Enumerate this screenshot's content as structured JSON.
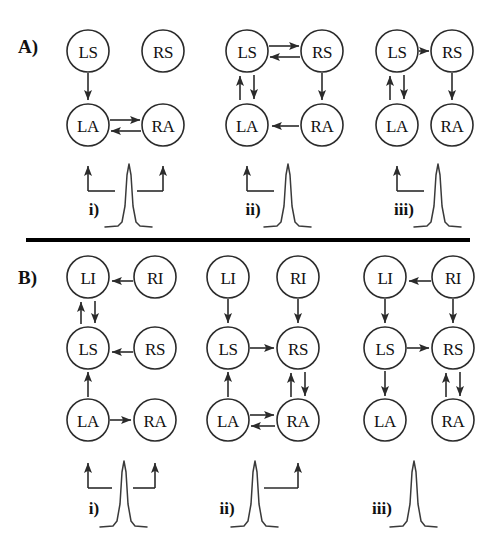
{
  "figure": {
    "width": 491,
    "height": 546,
    "background_color": "#ffffff",
    "line_color": "#2b2b2b",
    "divider_color": "#000000"
  },
  "panels": [
    {
      "id": "A",
      "label": "A)",
      "nodes_legend": [
        "LS",
        "RS",
        "LA",
        "RA"
      ],
      "columns": [
        {
          "id": "A-i",
          "sub_label": "i)",
          "nodes": [
            {
              "name": "LS",
              "row": "top",
              "side": "left"
            },
            {
              "name": "RS",
              "row": "top",
              "side": "right"
            },
            {
              "name": "LA",
              "row": "bottom",
              "side": "left"
            },
            {
              "name": "RA",
              "row": "bottom",
              "side": "right"
            }
          ],
          "edges": [
            {
              "from": "LS",
              "to": "LA",
              "kind": "vertical-down"
            },
            {
              "from": "LA",
              "to": "RA",
              "kind": "horizontal-bidirectional"
            }
          ],
          "stimulus": {
            "targets": [
              "LA",
              "RA"
            ],
            "bracket": "both"
          }
        },
        {
          "id": "A-ii",
          "sub_label": "ii)",
          "nodes": [
            {
              "name": "LS",
              "row": "top",
              "side": "left"
            },
            {
              "name": "RS",
              "row": "top",
              "side": "right"
            },
            {
              "name": "LA",
              "row": "bottom",
              "side": "left"
            },
            {
              "name": "RA",
              "row": "bottom",
              "side": "right"
            }
          ],
          "edges": [
            {
              "from": "LS",
              "to": "RS",
              "kind": "horizontal-bidirectional"
            },
            {
              "from": "LS",
              "to": "LA",
              "kind": "vertical-bidirectional"
            },
            {
              "from": "RS",
              "to": "RA",
              "kind": "vertical-down"
            },
            {
              "from": "RA",
              "to": "LA",
              "kind": "horizontal-left"
            }
          ],
          "stimulus": {
            "targets": [
              "LA"
            ],
            "bracket": "left"
          }
        },
        {
          "id": "A-iii",
          "sub_label": "iii)",
          "nodes": [
            {
              "name": "LS",
              "row": "top",
              "side": "left"
            },
            {
              "name": "RS",
              "row": "top",
              "side": "right"
            },
            {
              "name": "LA",
              "row": "bottom",
              "side": "left"
            },
            {
              "name": "RA",
              "row": "bottom",
              "side": "right"
            }
          ],
          "edges": [
            {
              "from": "LS",
              "to": "RS",
              "kind": "horizontal-right"
            },
            {
              "from": "LS",
              "to": "LA",
              "kind": "vertical-bidirectional"
            },
            {
              "from": "RS",
              "to": "RA",
              "kind": "vertical-down"
            }
          ],
          "stimulus": {
            "targets": [
              "LA"
            ],
            "bracket": "left"
          }
        }
      ]
    },
    {
      "id": "B",
      "label": "B)",
      "nodes_legend": [
        "LI",
        "RI",
        "LS",
        "RS",
        "LA",
        "RA"
      ],
      "columns": [
        {
          "id": "B-i",
          "sub_label": "i)",
          "nodes": [
            {
              "name": "LI",
              "row": "top",
              "side": "left"
            },
            {
              "name": "RI",
              "row": "top",
              "side": "right"
            },
            {
              "name": "LS",
              "row": "middle",
              "side": "left"
            },
            {
              "name": "RS",
              "row": "middle",
              "side": "right"
            },
            {
              "name": "LA",
              "row": "bottom",
              "side": "left"
            },
            {
              "name": "RA",
              "row": "bottom",
              "side": "right"
            }
          ],
          "edges": [
            {
              "from": "RI",
              "to": "LI",
              "kind": "horizontal-left"
            },
            {
              "from": "LI",
              "to": "LS",
              "kind": "vertical-bidirectional"
            },
            {
              "from": "RS",
              "to": "LS",
              "kind": "horizontal-left"
            },
            {
              "from": "LA",
              "to": "LS",
              "kind": "vertical-up"
            },
            {
              "from": "LA",
              "to": "RA",
              "kind": "horizontal-right"
            }
          ],
          "stimulus": {
            "targets": [
              "LA",
              "RA"
            ],
            "bracket": "both"
          }
        },
        {
          "id": "B-ii",
          "sub_label": "ii)",
          "nodes": [
            {
              "name": "LI",
              "row": "top",
              "side": "left"
            },
            {
              "name": "RI",
              "row": "top",
              "side": "right"
            },
            {
              "name": "LS",
              "row": "middle",
              "side": "left"
            },
            {
              "name": "RS",
              "row": "middle",
              "side": "right"
            },
            {
              "name": "LA",
              "row": "bottom",
              "side": "left"
            },
            {
              "name": "RA",
              "row": "bottom",
              "side": "right"
            }
          ],
          "edges": [
            {
              "from": "LI",
              "to": "LS",
              "kind": "vertical-down"
            },
            {
              "from": "RI",
              "to": "RS",
              "kind": "vertical-down"
            },
            {
              "from": "LS",
              "to": "RS",
              "kind": "horizontal-right"
            },
            {
              "from": "LA",
              "to": "LS",
              "kind": "vertical-up"
            },
            {
              "from": "RA",
              "to": "RS",
              "kind": "vertical-bidirectional"
            },
            {
              "from": "LA",
              "to": "RA",
              "kind": "horizontal-bidirectional"
            }
          ],
          "stimulus": {
            "targets": [
              "RA"
            ],
            "bracket": "right"
          }
        },
        {
          "id": "B-iii",
          "sub_label": "iii)",
          "nodes": [
            {
              "name": "LI",
              "row": "top",
              "side": "left"
            },
            {
              "name": "RI",
              "row": "top",
              "side": "right"
            },
            {
              "name": "LS",
              "row": "middle",
              "side": "left"
            },
            {
              "name": "RS",
              "row": "middle",
              "side": "right"
            },
            {
              "name": "LA",
              "row": "bottom",
              "side": "left"
            },
            {
              "name": "RA",
              "row": "bottom",
              "side": "right"
            }
          ],
          "edges": [
            {
              "from": "RI",
              "to": "LI",
              "kind": "horizontal-left"
            },
            {
              "from": "LI",
              "to": "LS",
              "kind": "vertical-down"
            },
            {
              "from": "RI",
              "to": "RS",
              "kind": "vertical-down"
            },
            {
              "from": "LS",
              "to": "RS",
              "kind": "horizontal-right"
            },
            {
              "from": "LS",
              "to": "LA",
              "kind": "vertical-down"
            },
            {
              "from": "RA",
              "to": "RS",
              "kind": "vertical-bidirectional"
            }
          ],
          "stimulus": {
            "targets": [],
            "bracket": "none"
          }
        }
      ]
    }
  ],
  "labels": {
    "panel_a": "A)",
    "panel_b": "B)",
    "sub_i": "i)",
    "sub_ii": "ii)",
    "sub_iii": "iii)",
    "node_LS": "LS",
    "node_RS": "RS",
    "node_LA": "LA",
    "node_RA": "RA",
    "node_LI": "LI",
    "node_RI": "RI"
  }
}
